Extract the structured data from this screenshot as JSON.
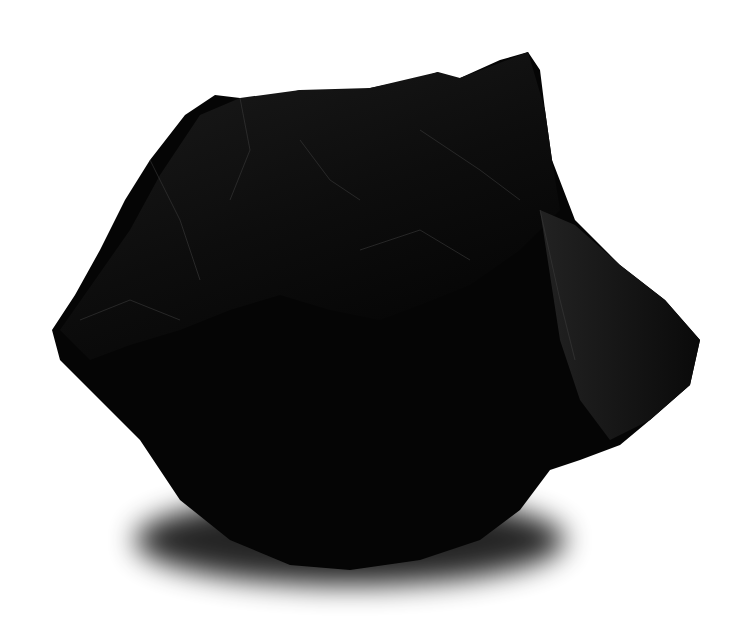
{
  "image": {
    "subject": "black coal rock",
    "background_color": "#ffffff",
    "rock_color": "#050505",
    "highlight_color": "#3a3a3a",
    "shadow_color": "#000000"
  }
}
